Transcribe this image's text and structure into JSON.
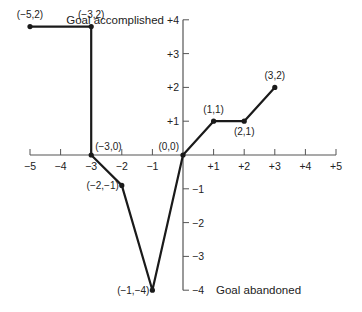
{
  "chart_data": {
    "type": "line",
    "title": "",
    "xlabel": "",
    "ylabel_top": "Goal accomplished",
    "ylabel_bottom": "Goal abandoned",
    "xlim": [
      -5,
      5
    ],
    "ylim": [
      -4,
      4
    ],
    "grid": false,
    "legend": null,
    "x_ticks": [
      "-5",
      "-4",
      "-3",
      "-2",
      "-1",
      "+1",
      "+2",
      "+3",
      "+4",
      "+5"
    ],
    "y_ticks": [
      "+4",
      "+3",
      "+2",
      "+1",
      "-1",
      "-2",
      "-3",
      "-4"
    ],
    "series": [
      {
        "name": "left path",
        "points": [
          {
            "x": -5,
            "y": 2,
            "label": "(−5,2)",
            "plot_y": 3.8
          },
          {
            "x": -3,
            "y": 2,
            "label": "(−3,2)",
            "plot_y": 3.8
          },
          {
            "x": -3,
            "y": 0,
            "label": "(−3,0)",
            "plot_y": 0
          },
          {
            "x": -2,
            "y": -1,
            "label": "(−2,−1)",
            "plot_y": -0.9
          },
          {
            "x": -1,
            "y": -4,
            "label": "(−1,−4)",
            "plot_y": -4
          },
          {
            "x": 0,
            "y": 0,
            "label": "(0,0)",
            "plot_y": 0
          },
          {
            "x": 1,
            "y": 1,
            "label": "(1,1)",
            "plot_y": 1
          },
          {
            "x": 2,
            "y": 1,
            "label": "(2,1)",
            "plot_y": 1
          },
          {
            "x": 3,
            "y": 2,
            "label": "(3,2)",
            "plot_y": 2
          }
        ]
      }
    ]
  },
  "style": {
    "line_color": "#1a1a1a",
    "axis_color": "#555555",
    "text_color": "#222222"
  }
}
